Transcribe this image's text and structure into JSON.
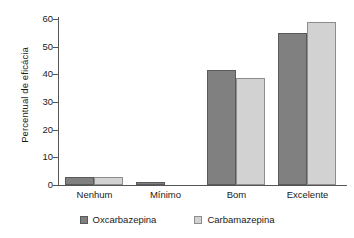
{
  "chart_data": {
    "type": "bar",
    "title": "",
    "subtitle": "",
    "xlabel": "",
    "ylabel": "Percentual de eficácia",
    "categories": [
      "Nenhum",
      "Mínimo",
      "Bom",
      "Excelente"
    ],
    "series": [
      {
        "name": "Oxcarbazepina",
        "color": "#808080",
        "values": [
          3,
          1.2,
          41.5,
          55
        ]
      },
      {
        "name": "Carbamazepina",
        "color": "#d2d2d2",
        "values": [
          3,
          0,
          38.5,
          59
        ]
      }
    ],
    "ylim": [
      0,
      60
    ],
    "yticks": [
      0,
      10,
      20,
      30,
      40,
      50,
      60
    ],
    "ytick_labels": [
      "0",
      "10",
      "20",
      "30",
      "40",
      "50",
      "60"
    ],
    "grid": false,
    "legend_position": "bottom",
    "legend_entries": [
      "Oxcarbazepina",
      "Carbamazepina"
    ],
    "annotations": []
  },
  "axis": {
    "y_title": "Percentual de eficácia",
    "line_color": "#555555"
  }
}
